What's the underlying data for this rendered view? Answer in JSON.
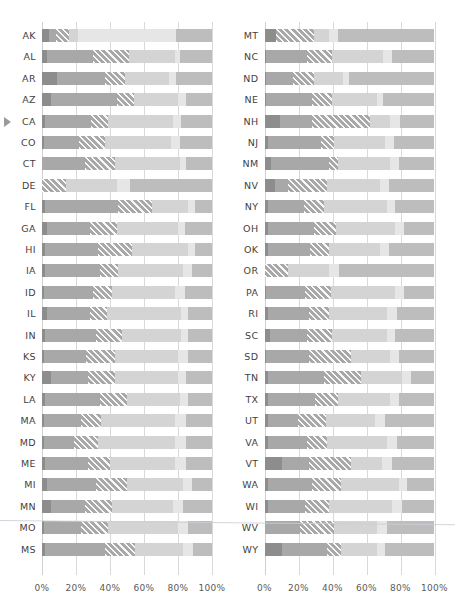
{
  "chart_data": {
    "type": "bar",
    "subtype": "stacked-horizontal-100pct",
    "title": "",
    "xlabel": "",
    "ylabel": "",
    "xlim": [
      0,
      100
    ],
    "grid": true,
    "legend": "none",
    "panels": 2,
    "axis_ticks": [
      "0%",
      "20%",
      "40%",
      "60%",
      "80%",
      "100%"
    ],
    "axis_tick_values": [
      0,
      20,
      40,
      60,
      80,
      100
    ],
    "series": [
      {
        "name": "segment-1",
        "style": "solid-dark",
        "color": "#8d8d8d"
      },
      {
        "name": "segment-2",
        "style": "solid-medium",
        "color": "#a8a8a8"
      },
      {
        "name": "segment-3",
        "style": "hatched-medium",
        "color": "#a8a8a8"
      },
      {
        "name": "segment-4",
        "style": "solid-light",
        "color": "#d4d4d4"
      },
      {
        "name": "segment-5",
        "style": "solid-lighter",
        "color": "#e6e6e6"
      },
      {
        "name": "segment-6",
        "style": "solid-mid",
        "color": "#bdbdbd"
      }
    ],
    "highlighted_category": "CA",
    "left": {
      "categories": [
        "AK",
        "AL",
        "AR",
        "AZ",
        "CA",
        "CO",
        "CT",
        "DE",
        "FL",
        "GA",
        "HI",
        "IA",
        "ID",
        "IL",
        "IN",
        "KS",
        "KY",
        "LA",
        "MA",
        "MD",
        "ME",
        "MI",
        "MN",
        "MO",
        "MS"
      ],
      "values": [
        [
          4,
          4,
          8,
          5,
          58,
          21
        ],
        [
          3,
          27,
          21,
          27,
          3,
          19
        ],
        [
          9,
          28,
          12,
          26,
          4,
          21
        ],
        [
          5,
          39,
          10,
          26,
          5,
          15
        ],
        [
          2,
          27,
          10,
          38,
          5,
          18
        ],
        [
          1,
          21,
          15,
          39,
          5,
          19
        ],
        [
          0,
          25,
          18,
          38,
          4,
          15
        ],
        [
          0,
          0,
          14,
          30,
          8,
          48
        ],
        [
          2,
          43,
          20,
          21,
          4,
          10
        ],
        [
          3,
          25,
          16,
          36,
          4,
          16
        ],
        [
          2,
          31,
          20,
          33,
          4,
          10
        ],
        [
          2,
          32,
          11,
          38,
          5,
          12
        ],
        [
          1,
          29,
          11,
          37,
          6,
          16
        ],
        [
          3,
          25,
          10,
          44,
          4,
          14
        ],
        [
          2,
          30,
          15,
          35,
          4,
          14
        ],
        [
          1,
          25,
          17,
          37,
          6,
          14
        ],
        [
          5,
          22,
          16,
          37,
          5,
          15
        ],
        [
          2,
          32,
          16,
          31,
          5,
          14
        ],
        [
          1,
          22,
          12,
          43,
          7,
          15
        ],
        [
          1,
          18,
          14,
          45,
          7,
          15
        ],
        [
          2,
          25,
          13,
          38,
          7,
          15
        ],
        [
          3,
          29,
          18,
          33,
          5,
          12
        ],
        [
          5,
          20,
          16,
          36,
          6,
          17
        ],
        [
          1,
          22,
          16,
          41,
          6,
          14
        ],
        [
          2,
          35,
          18,
          28,
          6,
          11
        ]
      ]
    },
    "right": {
      "categories": [
        "MT",
        "NC",
        "ND",
        "NE",
        "NH",
        "NJ",
        "NM",
        "NV",
        "NY",
        "OH",
        "OK",
        "OR",
        "PA",
        "RI",
        "SC",
        "SD",
        "TN",
        "TX",
        "UT",
        "VA",
        "VT",
        "WA",
        "WI",
        "WV",
        "WY"
      ],
      "values": [
        [
          7,
          0,
          22,
          9,
          5,
          57
        ],
        [
          1,
          24,
          15,
          30,
          5,
          25
        ],
        [
          1,
          16,
          12,
          17,
          4,
          50
        ],
        [
          1,
          27,
          12,
          26,
          4,
          30
        ],
        [
          9,
          19,
          34,
          12,
          6,
          20
        ],
        [
          2,
          31,
          8,
          30,
          5,
          24
        ],
        [
          4,
          34,
          5,
          31,
          5,
          21
        ],
        [
          6,
          8,
          23,
          31,
          5,
          27
        ],
        [
          2,
          21,
          12,
          37,
          5,
          23
        ],
        [
          2,
          27,
          13,
          35,
          5,
          18
        ],
        [
          2,
          25,
          11,
          30,
          5,
          27
        ],
        [
          0,
          0,
          14,
          24,
          6,
          56
        ],
        [
          1,
          23,
          15,
          38,
          5,
          18
        ],
        [
          2,
          24,
          12,
          34,
          6,
          22
        ],
        [
          3,
          22,
          15,
          32,
          5,
          23
        ],
        [
          1,
          25,
          25,
          23,
          5,
          21
        ],
        [
          2,
          33,
          22,
          24,
          5,
          14
        ],
        [
          2,
          28,
          13,
          31,
          5,
          21
        ],
        [
          2,
          18,
          16,
          29,
          6,
          29
        ],
        [
          2,
          23,
          12,
          35,
          6,
          22
        ],
        [
          10,
          16,
          25,
          18,
          6,
          25
        ],
        [
          2,
          26,
          17,
          34,
          5,
          16
        ],
        [
          2,
          22,
          14,
          37,
          6,
          19
        ],
        [
          0,
          21,
          20,
          25,
          6,
          28
        ],
        [
          10,
          27,
          8,
          21,
          5,
          29
        ]
      ]
    }
  }
}
